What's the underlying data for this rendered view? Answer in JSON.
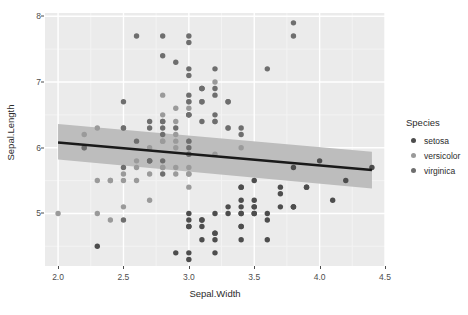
{
  "chart_data": {
    "type": "scatter",
    "title": "",
    "xlabel": "Sepal.Width",
    "ylabel": "Sepal.Length",
    "xlim": [
      1.9,
      4.5
    ],
    "ylim": [
      4.2,
      8.05
    ],
    "xticks": [
      "2.0",
      "2.5",
      "3.0",
      "3.5",
      "4.0",
      "4.5"
    ],
    "xtickvals": [
      2.0,
      2.5,
      3.0,
      3.5,
      4.0,
      4.5
    ],
    "yticks": [
      "5",
      "6",
      "7",
      "8"
    ],
    "ytickvals": [
      5,
      6,
      7,
      8
    ],
    "grid": true,
    "grid_color": "#ffffff",
    "panel_background": "#ebebeb",
    "legend": {
      "title": "Species",
      "position": "right",
      "entries": [
        {
          "name": "setosa",
          "color": "#4d4d4d"
        },
        {
          "name": "versicolor",
          "color": "#9a9a9a"
        },
        {
          "name": "virginica",
          "color": "#6e6e6e"
        }
      ]
    },
    "smooth": {
      "method": "lm",
      "line_color": "#1a1a1a",
      "band_color": "#bdbdbd",
      "x_start": 2.0,
      "x_end": 4.4,
      "y_start": 6.08,
      "y_end": 5.66,
      "band_lower_start": 5.82,
      "band_upper_start": 6.36,
      "band_lower_end": 5.38,
      "band_upper_end": 5.94
    },
    "series": [
      {
        "name": "setosa",
        "color": "#4d4d4d",
        "points": [
          [
            3.5,
            5.1
          ],
          [
            3.0,
            4.9
          ],
          [
            3.2,
            4.7
          ],
          [
            3.1,
            4.6
          ],
          [
            3.6,
            5.0
          ],
          [
            3.9,
            5.4
          ],
          [
            3.4,
            4.6
          ],
          [
            3.4,
            5.0
          ],
          [
            2.9,
            4.4
          ],
          [
            3.1,
            4.9
          ],
          [
            3.7,
            5.4
          ],
          [
            3.4,
            4.8
          ],
          [
            3.0,
            4.8
          ],
          [
            3.0,
            4.3
          ],
          [
            4.0,
            5.8
          ],
          [
            4.4,
            5.7
          ],
          [
            3.9,
            5.4
          ],
          [
            3.5,
            5.1
          ],
          [
            3.8,
            5.7
          ],
          [
            3.8,
            5.1
          ],
          [
            3.4,
            5.4
          ],
          [
            3.7,
            5.1
          ],
          [
            3.6,
            4.6
          ],
          [
            3.3,
            5.1
          ],
          [
            3.4,
            4.8
          ],
          [
            3.0,
            5.0
          ],
          [
            3.4,
            5.0
          ],
          [
            3.5,
            5.2
          ],
          [
            3.4,
            5.2
          ],
          [
            3.2,
            4.7
          ],
          [
            3.1,
            4.8
          ],
          [
            3.4,
            5.4
          ],
          [
            4.1,
            5.2
          ],
          [
            4.2,
            5.5
          ],
          [
            3.1,
            4.9
          ],
          [
            3.2,
            5.0
          ],
          [
            3.5,
            5.5
          ],
          [
            3.6,
            4.9
          ],
          [
            3.0,
            4.4
          ],
          [
            3.4,
            5.1
          ],
          [
            3.5,
            5.0
          ],
          [
            2.3,
            4.5
          ],
          [
            3.2,
            4.4
          ],
          [
            3.5,
            5.0
          ],
          [
            3.8,
            5.1
          ],
          [
            3.0,
            4.8
          ],
          [
            3.8,
            5.1
          ],
          [
            3.2,
            4.6
          ],
          [
            3.7,
            5.3
          ],
          [
            3.3,
            5.0
          ]
        ]
      },
      {
        "name": "versicolor",
        "color": "#9a9a9a",
        "points": [
          [
            3.2,
            7.0
          ],
          [
            3.2,
            6.4
          ],
          [
            3.1,
            6.9
          ],
          [
            2.3,
            5.5
          ],
          [
            2.8,
            6.5
          ],
          [
            2.8,
            5.7
          ],
          [
            3.3,
            6.3
          ],
          [
            2.4,
            4.9
          ],
          [
            2.9,
            6.6
          ],
          [
            2.7,
            5.2
          ],
          [
            2.0,
            5.0
          ],
          [
            3.0,
            5.9
          ],
          [
            2.2,
            6.0
          ],
          [
            2.9,
            6.1
          ],
          [
            2.9,
            5.6
          ],
          [
            3.1,
            6.7
          ],
          [
            3.0,
            5.6
          ],
          [
            2.7,
            5.8
          ],
          [
            2.2,
            6.2
          ],
          [
            2.5,
            5.6
          ],
          [
            3.2,
            5.9
          ],
          [
            2.8,
            6.1
          ],
          [
            2.5,
            6.3
          ],
          [
            2.8,
            6.1
          ],
          [
            2.9,
            6.4
          ],
          [
            3.0,
            6.6
          ],
          [
            2.8,
            6.8
          ],
          [
            3.0,
            6.7
          ],
          [
            2.9,
            6.0
          ],
          [
            2.6,
            5.7
          ],
          [
            2.4,
            5.5
          ],
          [
            2.4,
            5.5
          ],
          [
            2.7,
            5.8
          ],
          [
            2.7,
            6.0
          ],
          [
            3.0,
            5.4
          ],
          [
            3.4,
            6.0
          ],
          [
            3.1,
            6.7
          ],
          [
            2.3,
            6.3
          ],
          [
            3.0,
            5.6
          ],
          [
            2.5,
            5.5
          ],
          [
            2.6,
            5.5
          ],
          [
            3.0,
            6.1
          ],
          [
            2.6,
            5.8
          ],
          [
            2.3,
            5.0
          ],
          [
            2.7,
            5.6
          ],
          [
            3.0,
            5.7
          ],
          [
            2.9,
            5.7
          ],
          [
            2.9,
            6.2
          ],
          [
            2.5,
            5.1
          ],
          [
            2.8,
            5.7
          ]
        ]
      },
      {
        "name": "virginica",
        "color": "#6e6e6e",
        "points": [
          [
            3.3,
            6.3
          ],
          [
            2.7,
            5.8
          ],
          [
            3.0,
            7.1
          ],
          [
            2.9,
            6.3
          ],
          [
            3.0,
            6.5
          ],
          [
            3.0,
            7.6
          ],
          [
            2.5,
            4.9
          ],
          [
            2.9,
            7.3
          ],
          [
            2.5,
            6.7
          ],
          [
            3.6,
            7.2
          ],
          [
            3.2,
            6.5
          ],
          [
            2.7,
            6.4
          ],
          [
            3.0,
            6.8
          ],
          [
            2.5,
            5.7
          ],
          [
            2.8,
            5.8
          ],
          [
            3.2,
            6.4
          ],
          [
            3.0,
            6.5
          ],
          [
            3.8,
            7.7
          ],
          [
            2.6,
            7.7
          ],
          [
            2.2,
            6.0
          ],
          [
            3.2,
            6.9
          ],
          [
            2.8,
            5.6
          ],
          [
            2.8,
            7.7
          ],
          [
            2.7,
            6.3
          ],
          [
            3.3,
            6.7
          ],
          [
            3.2,
            7.2
          ],
          [
            2.8,
            6.2
          ],
          [
            3.0,
            6.1
          ],
          [
            2.8,
            6.4
          ],
          [
            3.0,
            7.2
          ],
          [
            2.8,
            7.4
          ],
          [
            3.8,
            7.9
          ],
          [
            2.8,
            6.4
          ],
          [
            2.8,
            6.3
          ],
          [
            2.6,
            6.1
          ],
          [
            3.0,
            7.7
          ],
          [
            3.4,
            6.3
          ],
          [
            3.1,
            6.4
          ],
          [
            3.0,
            6.0
          ],
          [
            3.1,
            6.9
          ],
          [
            3.1,
            6.7
          ],
          [
            3.1,
            6.9
          ],
          [
            2.7,
            5.8
          ],
          [
            3.2,
            6.8
          ],
          [
            3.3,
            6.7
          ],
          [
            3.0,
            6.7
          ],
          [
            2.5,
            6.3
          ],
          [
            3.0,
            6.5
          ],
          [
            3.4,
            6.2
          ],
          [
            3.0,
            5.9
          ]
        ]
      }
    ]
  }
}
